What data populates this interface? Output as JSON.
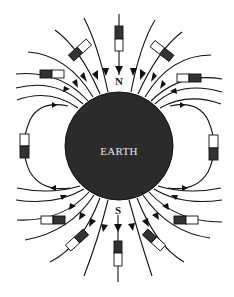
{
  "diagram": {
    "earth": {
      "label": "EARTH",
      "fill": "#2b2b2b",
      "cx": 119,
      "cy": 146,
      "r": 54
    },
    "poles": {
      "north_label": "N",
      "south_label": "S"
    },
    "colors": {
      "line": "#111111",
      "needle_dark": "#333333",
      "needle_light": "#ffffff",
      "background": "#ffffff"
    },
    "compass_count": 14,
    "compass_note": "Dark half = north-seeking end of compass needle"
  }
}
